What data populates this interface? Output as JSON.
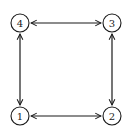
{
  "diagram": {
    "type": "graph",
    "nodes": [
      {
        "id": "1",
        "label": "1",
        "x": 20,
        "y": 116
      },
      {
        "id": "2",
        "label": "2",
        "x": 112,
        "y": 116
      },
      {
        "id": "3",
        "label": "3",
        "x": 112,
        "y": 23
      },
      {
        "id": "4",
        "label": "4",
        "x": 20,
        "y": 23
      }
    ],
    "edges": [
      {
        "from": "4",
        "to": "3",
        "direction": "bidirectional"
      },
      {
        "from": "3",
        "to": "2",
        "direction": "bidirectional"
      },
      {
        "from": "1",
        "to": "2",
        "direction": "bidirectional"
      },
      {
        "from": "4",
        "to": "1",
        "direction": "bidirectional"
      }
    ],
    "colors": {
      "stroke": "#1a1a1a",
      "background": "#ffffff"
    }
  }
}
